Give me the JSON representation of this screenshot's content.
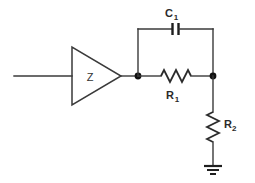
{
  "diagram": {
    "background_color": "#ffffff",
    "line_color": "#333333",
    "width": 255,
    "height": 183
  },
  "components": {
    "amplifier": {
      "label": "Z",
      "type": "triangle-amplifier"
    },
    "capacitor": {
      "label": "C",
      "subscript": "1",
      "type": "capacitor",
      "orientation": "horizontal"
    },
    "resistor_series": {
      "label": "R",
      "subscript": "1",
      "type": "resistor",
      "orientation": "horizontal"
    },
    "resistor_shunt": {
      "label": "R",
      "subscript": "2",
      "type": "resistor",
      "orientation": "vertical"
    },
    "ground": {
      "type": "earth-ground",
      "bars": 3
    },
    "input_wire": {
      "type": "wire",
      "name": "input-line"
    },
    "nodes": [
      {
        "name": "node-left",
        "type": "junction-dot"
      },
      {
        "name": "node-right",
        "type": "junction-dot"
      }
    ]
  }
}
